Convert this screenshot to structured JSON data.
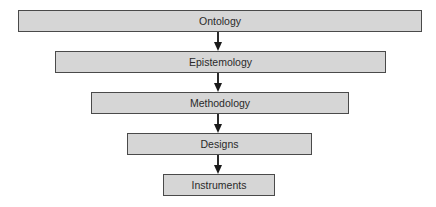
{
  "diagram": {
    "type": "hierarchy-flow",
    "direction": "top-to-bottom",
    "nodes": [
      {
        "id": "ontology",
        "label": "Ontology"
      },
      {
        "id": "epistemology",
        "label": "Epistemology"
      },
      {
        "id": "methodology",
        "label": "Methodology"
      },
      {
        "id": "designs",
        "label": "Designs"
      },
      {
        "id": "instruments",
        "label": "Instruments"
      }
    ],
    "edges": [
      {
        "from": "ontology",
        "to": "epistemology"
      },
      {
        "from": "epistemology",
        "to": "methodology"
      },
      {
        "from": "methodology",
        "to": "designs"
      },
      {
        "from": "designs",
        "to": "instruments"
      }
    ],
    "colors": {
      "box_fill": "#d6d6d6",
      "box_border": "#4a4a4a",
      "arrow": "#1a1a1a"
    }
  }
}
